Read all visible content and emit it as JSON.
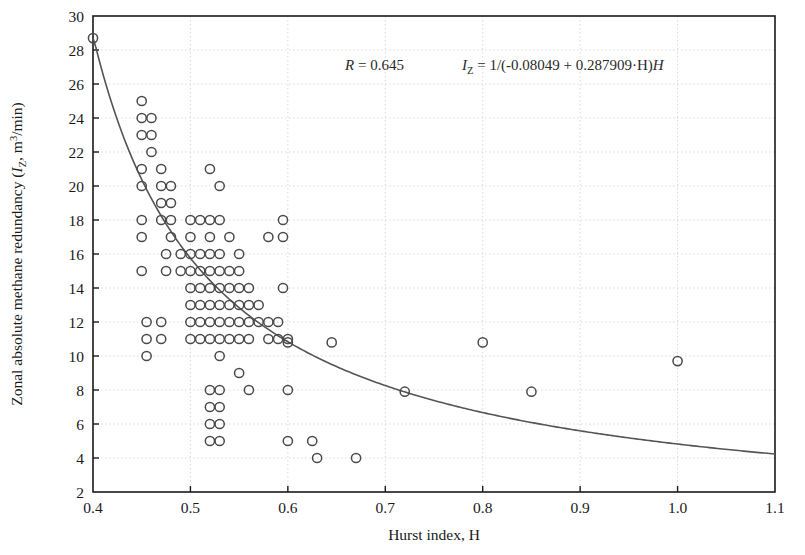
{
  "chart_data": {
    "type": "scatter",
    "title": "",
    "xlabel": "Hurst index, H",
    "ylabel": "Zonal absolute methane redundancy (I_Z, m³/min)",
    "ylabel_parts": {
      "prefix": "Zonal absolute methane redundancy (",
      "symbol": "I",
      "symbol_sub": "Z",
      "middle": ", m",
      "unit_sup": "3",
      "suffix": "/min)"
    },
    "xlim": [
      0.4,
      1.1
    ],
    "ylim": [
      2,
      30
    ],
    "xticks": [
      0.4,
      0.5,
      0.6,
      0.7,
      0.8,
      0.9,
      1.0,
      1.1
    ],
    "xtick_labels": [
      "0.4",
      "0.5",
      "0.6",
      "0.7",
      "0.8",
      "0.9",
      "1.0",
      "1.1"
    ],
    "yticks": [
      2,
      4,
      6,
      8,
      10,
      12,
      14,
      16,
      18,
      20,
      22,
      24,
      26,
      28,
      30
    ],
    "ytick_labels": [
      "2",
      "4",
      "6",
      "8",
      "10",
      "12",
      "14",
      "16",
      "18",
      "20",
      "22",
      "24",
      "26",
      "28",
      "30"
    ],
    "grid": true,
    "grid_style": "dotted",
    "grid_color": "#d9d9d9",
    "legend": "none",
    "marker": {
      "style": "open-circle",
      "edge_color": "#4a4a4a",
      "face_color": "none",
      "radius": 4.6,
      "line_width": 1.5
    },
    "annotations": {
      "correlation_label": "R",
      "correlation_value": "0.645",
      "correlation_text": "R = 0.645",
      "model_lhs": "I",
      "model_lhs_sub": "Z",
      "model_text": "I_Z = 1/(-0.08049 + 0.287909·H)",
      "model_rhs": "= 1/(-0.08049 + 0.287909·H)",
      "equation_a": -0.08049,
      "equation_b": 0.287909
    },
    "fit_curve": {
      "name": "regression",
      "form": "1/(a + b*H)",
      "a": -0.08049,
      "b": 0.287909,
      "color": "#555555",
      "line_width": 1.6,
      "x_start": 0.4,
      "x_end": 1.1,
      "y_start": 28.7,
      "y_end": 3.9
    },
    "points": [
      [
        0.4,
        28.7
      ],
      [
        0.45,
        25.0
      ],
      [
        0.45,
        24.0
      ],
      [
        0.45,
        23.0
      ],
      [
        0.45,
        21.0
      ],
      [
        0.45,
        20.0
      ],
      [
        0.45,
        18.0
      ],
      [
        0.45,
        17.0
      ],
      [
        0.45,
        15.0
      ],
      [
        0.46,
        24.0
      ],
      [
        0.46,
        23.0
      ],
      [
        0.46,
        22.0
      ],
      [
        0.47,
        21.0
      ],
      [
        0.47,
        20.0
      ],
      [
        0.47,
        19.0
      ],
      [
        0.47,
        18.0
      ],
      [
        0.455,
        12.0
      ],
      [
        0.455,
        11.0
      ],
      [
        0.455,
        10.0
      ],
      [
        0.47,
        12.0
      ],
      [
        0.47,
        11.0
      ],
      [
        0.475,
        16.0
      ],
      [
        0.475,
        15.0
      ],
      [
        0.48,
        20.0
      ],
      [
        0.48,
        19.0
      ],
      [
        0.48,
        18.0
      ],
      [
        0.48,
        17.0
      ],
      [
        0.49,
        16.0
      ],
      [
        0.49,
        15.0
      ],
      [
        0.5,
        18.0
      ],
      [
        0.5,
        17.0
      ],
      [
        0.5,
        16.0
      ],
      [
        0.5,
        15.0
      ],
      [
        0.5,
        14.0
      ],
      [
        0.5,
        13.0
      ],
      [
        0.5,
        12.0
      ],
      [
        0.5,
        11.0
      ],
      [
        0.51,
        18.0
      ],
      [
        0.51,
        16.0
      ],
      [
        0.51,
        15.0
      ],
      [
        0.51,
        14.0
      ],
      [
        0.51,
        13.0
      ],
      [
        0.51,
        12.0
      ],
      [
        0.51,
        11.0
      ],
      [
        0.52,
        21.0
      ],
      [
        0.52,
        18.0
      ],
      [
        0.52,
        17.0
      ],
      [
        0.52,
        16.0
      ],
      [
        0.52,
        15.0
      ],
      [
        0.52,
        14.0
      ],
      [
        0.52,
        13.0
      ],
      [
        0.52,
        12.0
      ],
      [
        0.52,
        11.0
      ],
      [
        0.52,
        8.0
      ],
      [
        0.52,
        7.0
      ],
      [
        0.52,
        6.0
      ],
      [
        0.52,
        5.0
      ],
      [
        0.53,
        20.0
      ],
      [
        0.53,
        18.0
      ],
      [
        0.53,
        16.0
      ],
      [
        0.53,
        15.0
      ],
      [
        0.53,
        14.0
      ],
      [
        0.53,
        13.0
      ],
      [
        0.53,
        12.0
      ],
      [
        0.53,
        11.0
      ],
      [
        0.53,
        10.0
      ],
      [
        0.53,
        8.0
      ],
      [
        0.53,
        7.0
      ],
      [
        0.53,
        6.0
      ],
      [
        0.53,
        5.0
      ],
      [
        0.54,
        17.0
      ],
      [
        0.54,
        15.0
      ],
      [
        0.54,
        14.0
      ],
      [
        0.54,
        13.0
      ],
      [
        0.54,
        12.0
      ],
      [
        0.54,
        11.0
      ],
      [
        0.55,
        16.0
      ],
      [
        0.55,
        15.0
      ],
      [
        0.55,
        14.0
      ],
      [
        0.55,
        13.0
      ],
      [
        0.55,
        12.0
      ],
      [
        0.55,
        11.0
      ],
      [
        0.55,
        9.0
      ],
      [
        0.56,
        14.0
      ],
      [
        0.56,
        13.0
      ],
      [
        0.56,
        12.0
      ],
      [
        0.56,
        11.0
      ],
      [
        0.56,
        8.0
      ],
      [
        0.57,
        13.0
      ],
      [
        0.57,
        12.0
      ],
      [
        0.58,
        17.0
      ],
      [
        0.58,
        12.0
      ],
      [
        0.58,
        11.0
      ],
      [
        0.59,
        12.0
      ],
      [
        0.59,
        11.0
      ],
      [
        0.595,
        18.0
      ],
      [
        0.595,
        17.0
      ],
      [
        0.595,
        14.0
      ],
      [
        0.6,
        11.0
      ],
      [
        0.6,
        10.8
      ],
      [
        0.6,
        8.0
      ],
      [
        0.6,
        5.0
      ],
      [
        0.625,
        5.0
      ],
      [
        0.63,
        4.0
      ],
      [
        0.645,
        10.8
      ],
      [
        0.67,
        4.0
      ],
      [
        0.72,
        7.9
      ],
      [
        0.8,
        10.8
      ],
      [
        0.85,
        7.9
      ],
      [
        1.0,
        9.7
      ]
    ]
  }
}
